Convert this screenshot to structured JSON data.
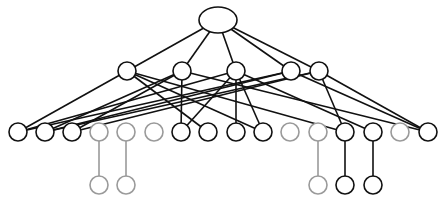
{
  "diagram": {
    "title": "",
    "type": "hierarchical-graph",
    "colors": {
      "active": "#111111",
      "inactive": "#9a9a9a",
      "background": "#ffffff"
    },
    "nodes": [
      {
        "id": "root",
        "x": 218,
        "y": 20,
        "rx": 19,
        "ry": 13,
        "active": true
      },
      {
        "id": "m1",
        "x": 127,
        "y": 71,
        "rx": 9,
        "ry": 9,
        "active": true
      },
      {
        "id": "m2",
        "x": 182,
        "y": 71,
        "rx": 9,
        "ry": 9,
        "active": true
      },
      {
        "id": "m3",
        "x": 236,
        "y": 71,
        "rx": 9,
        "ry": 9,
        "active": true
      },
      {
        "id": "m4",
        "x": 291,
        "y": 71,
        "rx": 9,
        "ry": 9,
        "active": true
      },
      {
        "id": "m5",
        "x": 319,
        "y": 71,
        "rx": 9,
        "ry": 9,
        "active": true
      },
      {
        "id": "b1",
        "x": 18,
        "y": 132,
        "rx": 9,
        "ry": 9,
        "active": true
      },
      {
        "id": "b2",
        "x": 45,
        "y": 132,
        "rx": 9,
        "ry": 9,
        "active": true
      },
      {
        "id": "b3",
        "x": 72,
        "y": 132,
        "rx": 9,
        "ry": 9,
        "active": true
      },
      {
        "id": "b4",
        "x": 99,
        "y": 132,
        "rx": 9,
        "ry": 9,
        "active": false
      },
      {
        "id": "b5",
        "x": 126,
        "y": 132,
        "rx": 9,
        "ry": 9,
        "active": false
      },
      {
        "id": "b6",
        "x": 154,
        "y": 132,
        "rx": 9,
        "ry": 9,
        "active": false
      },
      {
        "id": "b7",
        "x": 181,
        "y": 132,
        "rx": 9,
        "ry": 9,
        "active": true
      },
      {
        "id": "b8",
        "x": 208,
        "y": 132,
        "rx": 9,
        "ry": 9,
        "active": true
      },
      {
        "id": "b9",
        "x": 236,
        "y": 132,
        "rx": 9,
        "ry": 9,
        "active": true
      },
      {
        "id": "b10",
        "x": 263,
        "y": 132,
        "rx": 9,
        "ry": 9,
        "active": true
      },
      {
        "id": "b11",
        "x": 290,
        "y": 132,
        "rx": 9,
        "ry": 9,
        "active": false
      },
      {
        "id": "b12",
        "x": 318,
        "y": 132,
        "rx": 9,
        "ry": 9,
        "active": false
      },
      {
        "id": "b13",
        "x": 345,
        "y": 132,
        "rx": 9,
        "ry": 9,
        "active": true
      },
      {
        "id": "b14",
        "x": 373,
        "y": 132,
        "rx": 9,
        "ry": 9,
        "active": true
      },
      {
        "id": "b15",
        "x": 400,
        "y": 132,
        "rx": 9,
        "ry": 9,
        "active": false
      },
      {
        "id": "b16",
        "x": 428,
        "y": 132,
        "rx": 9,
        "ry": 9,
        "active": true
      },
      {
        "id": "l1",
        "x": 99,
        "y": 185,
        "rx": 9,
        "ry": 9,
        "active": false
      },
      {
        "id": "l2",
        "x": 126,
        "y": 185,
        "rx": 9,
        "ry": 9,
        "active": false
      },
      {
        "id": "l3",
        "x": 318,
        "y": 185,
        "rx": 9,
        "ry": 9,
        "active": false
      },
      {
        "id": "l4",
        "x": 345,
        "y": 185,
        "rx": 9,
        "ry": 9,
        "active": true
      },
      {
        "id": "l5",
        "x": 373,
        "y": 185,
        "rx": 9,
        "ry": 9,
        "active": true
      }
    ],
    "edges": [
      {
        "from": "root",
        "to": "m1",
        "active": true
      },
      {
        "from": "root",
        "to": "m2",
        "active": true
      },
      {
        "from": "root",
        "to": "m3",
        "active": true
      },
      {
        "from": "root",
        "to": "m4",
        "active": true
      },
      {
        "from": "root",
        "to": "m5",
        "active": true
      },
      {
        "from": "m1",
        "to": "b1",
        "active": true
      },
      {
        "from": "m1",
        "to": "b8",
        "active": true
      },
      {
        "from": "m1",
        "to": "b10",
        "active": true
      },
      {
        "from": "m1",
        "to": "b13",
        "active": true
      },
      {
        "from": "m2",
        "to": "b2",
        "active": true
      },
      {
        "from": "m2",
        "to": "b3",
        "active": true
      },
      {
        "from": "m2",
        "to": "b7",
        "active": true
      },
      {
        "from": "m2",
        "to": "b16",
        "active": true
      },
      {
        "from": "m3",
        "to": "b1",
        "active": true
      },
      {
        "from": "m3",
        "to": "b7",
        "active": true
      },
      {
        "from": "m3",
        "to": "b9",
        "active": true
      },
      {
        "from": "m3",
        "to": "b10",
        "active": true
      },
      {
        "from": "m3",
        "to": "b14",
        "active": true
      },
      {
        "from": "m4",
        "to": "b1",
        "active": true
      },
      {
        "from": "m4",
        "to": "b2",
        "active": true
      },
      {
        "from": "m4",
        "to": "b16",
        "active": true
      },
      {
        "from": "m5",
        "to": "b2",
        "active": true
      },
      {
        "from": "m5",
        "to": "b3",
        "active": true
      },
      {
        "from": "m5",
        "to": "b13",
        "active": true
      },
      {
        "from": "m5",
        "to": "b16",
        "active": true
      },
      {
        "from": "b4",
        "to": "l1",
        "active": false
      },
      {
        "from": "b5",
        "to": "l2",
        "active": false
      },
      {
        "from": "b12",
        "to": "l3",
        "active": false
      },
      {
        "from": "b13",
        "to": "l4",
        "active": true
      },
      {
        "from": "b14",
        "to": "l5",
        "active": true
      }
    ]
  }
}
